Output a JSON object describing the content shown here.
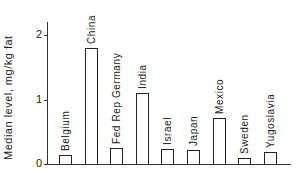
{
  "chart_data": {
    "type": "bar",
    "title": "",
    "xlabel": "",
    "ylabel": "Median level, mg/kg fat",
    "ylim": [
      0,
      2.2
    ],
    "yticks": [
      0,
      1,
      2
    ],
    "grid": false,
    "legend": null,
    "categories": [
      "Belgium",
      "China",
      "Fed Rep Germany",
      "India",
      "Israel",
      "Japan",
      "Mexico",
      "Sweden",
      "Yugoslavia"
    ],
    "values": [
      0.14,
      1.8,
      0.25,
      1.1,
      0.23,
      0.22,
      0.71,
      0.09,
      0.19
    ],
    "label_position": "above_bar_rotated"
  }
}
